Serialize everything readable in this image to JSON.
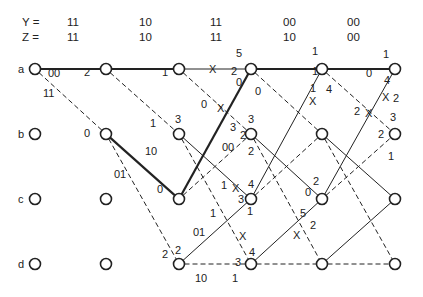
{
  "header": {
    "rows": [
      {
        "label": "Y =",
        "values": [
          "11",
          "10",
          "11",
          "00",
          "00"
        ]
      },
      {
        "label": "Z =",
        "values": [
          "11",
          "10",
          "11",
          "10",
          "00"
        ]
      }
    ]
  },
  "states": [
    "a",
    "b",
    "c",
    "d"
  ],
  "columns_x": [
    35,
    106,
    179,
    251,
    322,
    395
  ],
  "rows_y": [
    69,
    134,
    199,
    264
  ],
  "edges": [
    {
      "from": [
        0,
        0
      ],
      "to": [
        1,
        0
      ],
      "style": "bold"
    },
    {
      "from": [
        0,
        0
      ],
      "to": [
        1,
        1
      ],
      "style": "dashed"
    },
    {
      "from": [
        1,
        0
      ],
      "to": [
        2,
        0
      ],
      "style": "bold"
    },
    {
      "from": [
        1,
        0
      ],
      "to": [
        2,
        1
      ],
      "style": "dashed"
    },
    {
      "from": [
        1,
        1
      ],
      "to": [
        2,
        2
      ],
      "style": "bold"
    },
    {
      "from": [
        1,
        1
      ],
      "to": [
        2,
        3
      ],
      "style": "dashed"
    },
    {
      "from": [
        2,
        0
      ],
      "to": [
        3,
        0
      ],
      "style": "solid"
    },
    {
      "from": [
        2,
        0
      ],
      "to": [
        3,
        1
      ],
      "style": "dashed"
    },
    {
      "from": [
        2,
        1
      ],
      "to": [
        3,
        2
      ],
      "style": "solid"
    },
    {
      "from": [
        2,
        1
      ],
      "to": [
        3,
        3
      ],
      "style": "dashed"
    },
    {
      "from": [
        2,
        2
      ],
      "to": [
        3,
        0
      ],
      "style": "bold"
    },
    {
      "from": [
        2,
        2
      ],
      "to": [
        3,
        1
      ],
      "style": "dashed"
    },
    {
      "from": [
        2,
        3
      ],
      "to": [
        3,
        2
      ],
      "style": "solid"
    },
    {
      "from": [
        2,
        3
      ],
      "to": [
        3,
        3
      ],
      "style": "dashed"
    },
    {
      "from": [
        3,
        0
      ],
      "to": [
        4,
        0
      ],
      "style": "bold"
    },
    {
      "from": [
        3,
        0
      ],
      "to": [
        4,
        1
      ],
      "style": "dashed"
    },
    {
      "from": [
        3,
        1
      ],
      "to": [
        4,
        2
      ],
      "style": "solid"
    },
    {
      "from": [
        3,
        1
      ],
      "to": [
        4,
        3
      ],
      "style": "dashed"
    },
    {
      "from": [
        3,
        2
      ],
      "to": [
        4,
        0
      ],
      "style": "solid"
    },
    {
      "from": [
        3,
        2
      ],
      "to": [
        4,
        1
      ],
      "style": "dashed"
    },
    {
      "from": [
        3,
        3
      ],
      "to": [
        4,
        2
      ],
      "style": "solid"
    },
    {
      "from": [
        3,
        3
      ],
      "to": [
        4,
        3
      ],
      "style": "dashed"
    },
    {
      "from": [
        4,
        0
      ],
      "to": [
        5,
        0
      ],
      "style": "bold"
    },
    {
      "from": [
        4,
        0
      ],
      "to": [
        5,
        1
      ],
      "style": "dashed"
    },
    {
      "from": [
        4,
        1
      ],
      "to": [
        5,
        2
      ],
      "style": "solid"
    },
    {
      "from": [
        4,
        1
      ],
      "to": [
        5,
        3
      ],
      "style": "dashed"
    },
    {
      "from": [
        4,
        2
      ],
      "to": [
        5,
        0
      ],
      "style": "solid"
    },
    {
      "from": [
        4,
        2
      ],
      "to": [
        5,
        1
      ],
      "style": "dashed"
    },
    {
      "from": [
        4,
        3
      ],
      "to": [
        5,
        2
      ],
      "style": "solid"
    },
    {
      "from": [
        4,
        3
      ],
      "to": [
        5,
        3
      ],
      "style": "dashed"
    }
  ],
  "labels": [
    {
      "text": "00",
      "x": 48,
      "y": 77
    },
    {
      "text": "11",
      "x": 43,
      "y": 97
    },
    {
      "text": "2",
      "x": 84,
      "y": 76
    },
    {
      "text": "0",
      "x": 84,
      "y": 137
    },
    {
      "text": "1",
      "x": 162,
      "y": 76
    },
    {
      "text": "10",
      "x": 145,
      "y": 155
    },
    {
      "text": "01",
      "x": 114,
      "y": 178
    },
    {
      "text": "1",
      "x": 150,
      "y": 127
    },
    {
      "text": "3",
      "x": 175,
      "y": 123
    },
    {
      "text": "0",
      "x": 157,
      "y": 193
    },
    {
      "text": "5",
      "x": 236,
      "y": 57
    },
    {
      "text": "2",
      "x": 231,
      "y": 75
    },
    {
      "text": "0",
      "x": 236,
      "y": 86
    },
    {
      "text": "0",
      "x": 255,
      "y": 95
    },
    {
      "text": "0",
      "x": 201,
      "y": 108
    },
    {
      "text": "3",
      "x": 230,
      "y": 131
    },
    {
      "text": "3",
      "x": 248,
      "y": 123
    },
    {
      "text": "2",
      "x": 240,
      "y": 139
    },
    {
      "text": "00",
      "x": 222,
      "y": 151
    },
    {
      "text": "2",
      "x": 248,
      "y": 155
    },
    {
      "text": "1",
      "x": 221,
      "y": 189
    },
    {
      "text": "4",
      "x": 248,
      "y": 188
    },
    {
      "text": "3",
      "x": 238,
      "y": 203
    },
    {
      "text": "1",
      "x": 247,
      "y": 215
    },
    {
      "text": "1",
      "x": 210,
      "y": 217
    },
    {
      "text": "01",
      "x": 193,
      "y": 236
    },
    {
      "text": "2",
      "x": 162,
      "y": 258
    },
    {
      "text": "2",
      "x": 175,
      "y": 254
    },
    {
      "text": "10",
      "x": 195,
      "y": 282
    },
    {
      "text": "1",
      "x": 232,
      "y": 282
    },
    {
      "text": "3",
      "x": 235,
      "y": 266
    },
    {
      "text": "4",
      "x": 249,
      "y": 256
    },
    {
      "text": "1",
      "x": 312,
      "y": 55
    },
    {
      "text": "1",
      "x": 312,
      "y": 75
    },
    {
      "text": "1",
      "x": 310,
      "y": 92
    },
    {
      "text": "4",
      "x": 326,
      "y": 93
    },
    {
      "text": "0",
      "x": 366,
      "y": 77
    },
    {
      "text": "1",
      "x": 383,
      "y": 58
    },
    {
      "text": "4",
      "x": 384,
      "y": 84
    },
    {
      "text": "2",
      "x": 393,
      "y": 102
    },
    {
      "text": "2",
      "x": 354,
      "y": 115
    },
    {
      "text": "3",
      "x": 390,
      "y": 121
    },
    {
      "text": "2",
      "x": 378,
      "y": 138
    },
    {
      "text": "1",
      "x": 388,
      "y": 160
    },
    {
      "text": "2",
      "x": 313,
      "y": 185
    },
    {
      "text": "0",
      "x": 305,
      "y": 196
    },
    {
      "text": "5",
      "x": 300,
      "y": 217
    },
    {
      "text": "2",
      "x": 310,
      "y": 229
    }
  ],
  "x_marks": [
    {
      "x": 213,
      "y": 69
    },
    {
      "x": 221,
      "y": 108
    },
    {
      "x": 236,
      "y": 188
    },
    {
      "x": 243,
      "y": 236
    },
    {
      "x": 297,
      "y": 235
    },
    {
      "x": 313,
      "y": 101
    },
    {
      "x": 369,
      "y": 113
    },
    {
      "x": 386,
      "y": 97
    }
  ]
}
